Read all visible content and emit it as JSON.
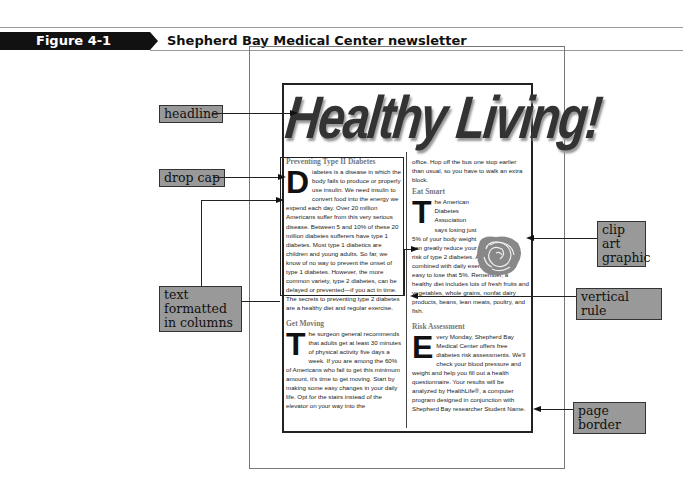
{
  "figure": {
    "number": "Figure 4-1",
    "title": "Shepherd Bay Medical Center newsletter"
  },
  "newsletter": {
    "headline": "Healthy Living!",
    "left_column": {
      "section1_heading": "Preventing Type II Diabetes",
      "section1_dropcap": "D",
      "section1_body": "iabetes is a disease in which the body fails to produce or properly use insulin. We need insulin to convert food into the energy we expend each day. Over 20 million Americans suffer from this very serious disease. Between 5 and 10% of these 20 million diabetes sufferers have type 1 diabetes. Most type 1 diabetics are children and young adults. So far, we know of no way to prevent the onset of type 1 diabetes. However, the more common variety, type 2 diabetes, can be delayed or prevented—if you act in time. The secrets to preventing type 2 diabetes are a healthy diet and regular exercise.",
      "section2_heading": "Get Moving",
      "section2_dropcap": "T",
      "section2_body": "he surgeon general recommends that adults get at least 30 minutes of physical activity five days a week. If you are among the 60% of Americans who fail to get this minimum amount, it's time to get moving. Start by making some easy changes in your daily life. Opt for the stairs instead of the elevator on your way into the"
    },
    "right_column": {
      "continuation": "office. Hop off the bus one stop earlier than usual, so you have to walk an extra block.",
      "section3_heading": "Eat Smart",
      "section3_dropcap": "T",
      "section3_body": "he American Diabetes Association says losing just 5% of your body weight can greatly reduce your risk of type 2 diabetes. A healthy diet combined with daily exercise makes it easy to lose that 5%. Remember, a healthy diet includes lots of fresh fruits and vegetables, whole grains, nonfat dairy products, beans, lean meats, poultry, and fish.",
      "section4_heading": "Risk Assessment",
      "section4_dropcap": "E",
      "section4_body": "very Monday, Shepherd Bay Medical Center offers free diabetes risk assessments. We'll check your blood pressure and weight and help you fill out a health questionnaire. Your results will be analyzed by HealthLife®, a computer program designed in conjunction with Shepherd Bay researcher Student Name."
    }
  },
  "callouts": {
    "headline": "headline",
    "drop_cap": "drop cap",
    "text_columns_line1": "text formatted",
    "text_columns_line2": "in columns",
    "clip_art_line1": "clip art",
    "clip_art_line2": "graphic",
    "vertical_rule": "vertical rule",
    "page_border": "page border"
  },
  "colors": {
    "callout_bg": "#999999",
    "heading_gray": "#777777",
    "figure_bar": "#111111"
  }
}
